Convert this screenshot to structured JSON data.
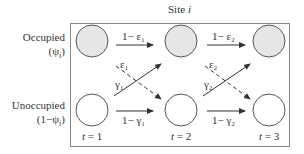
{
  "title": {
    "prefix": "Site ",
    "var": "i"
  },
  "rows": {
    "occupied": {
      "label": "Occupied",
      "sub": "(ψ",
      "sub_i": "i",
      "sub_close": ")"
    },
    "unoccupied": {
      "label": "Unoccupied",
      "sub": "(1−ψ",
      "sub_i": "i",
      "sub_close": ")"
    }
  },
  "times": [
    {
      "var": "t",
      "eq": " = 1"
    },
    {
      "var": "t",
      "eq": " = 2"
    },
    {
      "var": "t",
      "eq": " = 3"
    }
  ],
  "transitions": {
    "stay_occ_1": "1− ε₁",
    "stay_occ_2": "1− ε₂",
    "stay_unocc_1": "1− γ₁",
    "stay_unocc_2": "1− γ₂",
    "ext_1": "ε₁",
    "ext_2": "ε₂",
    "col_1": "γ₁",
    "col_2": "γ₂"
  },
  "colors": {
    "occupied_fill": "#e6e6e6",
    "unoccupied_fill": "#ffffff",
    "stroke": "#555555",
    "box": "#888888"
  }
}
